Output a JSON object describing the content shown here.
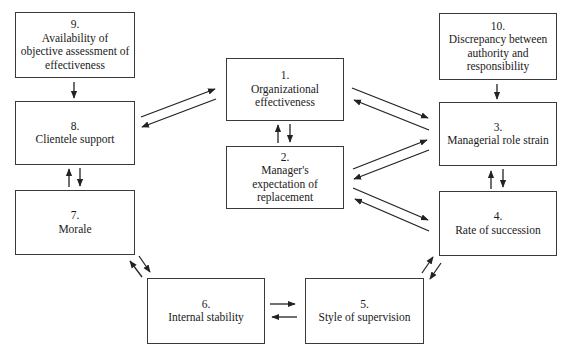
{
  "diagram": {
    "nodes": [
      {
        "id": "1",
        "number": "1.",
        "label": "Organizational\neffectiveness"
      },
      {
        "id": "2",
        "number": "2.",
        "label": "Manager's\nexpectation of\nreplacement"
      },
      {
        "id": "3",
        "number": "3.",
        "label": "Managerial role strain"
      },
      {
        "id": "4",
        "number": "4.",
        "label": "Rate of succession"
      },
      {
        "id": "5",
        "number": "5.",
        "label": "Style of supervision"
      },
      {
        "id": "6",
        "number": "6.",
        "label": "Internal stability"
      },
      {
        "id": "7",
        "number": "7.",
        "label": "Morale"
      },
      {
        "id": "8",
        "number": "8.",
        "label": "Clientele support"
      },
      {
        "id": "9",
        "number": "9.",
        "label": "Availability of\nobjective assessment of\neffectiveness"
      },
      {
        "id": "10",
        "number": "10.",
        "label": "Discrepancy between\nauthority and\nresponsibility"
      }
    ],
    "edges": [
      {
        "from": "9",
        "to": "8"
      },
      {
        "from": "10",
        "to": "3"
      },
      {
        "from": "8",
        "to": "1"
      },
      {
        "from": "1",
        "to": "8"
      },
      {
        "from": "1",
        "to": "2"
      },
      {
        "from": "2",
        "to": "1"
      },
      {
        "from": "1",
        "to": "3"
      },
      {
        "from": "3",
        "to": "1"
      },
      {
        "from": "2",
        "to": "3"
      },
      {
        "from": "3",
        "to": "2"
      },
      {
        "from": "2",
        "to": "4"
      },
      {
        "from": "4",
        "to": "2"
      },
      {
        "from": "3",
        "to": "4"
      },
      {
        "from": "4",
        "to": "3"
      },
      {
        "from": "7",
        "to": "8"
      },
      {
        "from": "8",
        "to": "7"
      },
      {
        "from": "7",
        "to": "6"
      },
      {
        "from": "6",
        "to": "7"
      },
      {
        "from": "6",
        "to": "5"
      },
      {
        "from": "5",
        "to": "6"
      },
      {
        "from": "5",
        "to": "4"
      },
      {
        "from": "4",
        "to": "5"
      }
    ],
    "line_color": "#222222"
  }
}
